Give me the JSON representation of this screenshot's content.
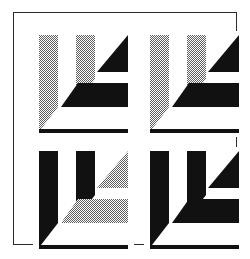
{
  "figure": {
    "background_color": "#ffffff",
    "frame": {
      "stroke_color": "#2b2b2b",
      "stroke_width_px": 1,
      "x": 13,
      "y": 12,
      "width": 224,
      "height": 233
    },
    "tones": {
      "black": "#111111",
      "halftone_gray": "#a8a8a8",
      "halftone_dot_color": "#6f6f6f",
      "paper": "#ffffff"
    },
    "grid": {
      "rows": 2,
      "columns": 2,
      "cell_width": 101,
      "cell_height": 106,
      "gap": 10
    },
    "motif": {
      "name": "angular-bracket-glyph",
      "parts": [
        "left-vertical-bar",
        "middle-vertical-bar",
        "upper-right-triangle",
        "horizontal-band",
        "baseline-rule"
      ]
    },
    "panels": [
      {
        "id": "panel-top-left",
        "position": "top-left",
        "label": "Panel 1",
        "left_bar_tone": "halftone",
        "middle_bar_tone": "halftone",
        "triangle_tone": "black",
        "band_tone": "black",
        "baseline_tone": "black"
      },
      {
        "id": "panel-top-right",
        "position": "top-right",
        "label": "Panel 2",
        "left_bar_tone": "halftone",
        "middle_bar_tone": "halftone",
        "triangle_tone": "black",
        "band_tone": "black",
        "baseline_tone": "black"
      },
      {
        "id": "panel-bottom-left",
        "position": "bottom-left",
        "label": "Panel 3",
        "left_bar_tone": "black",
        "middle_bar_tone": "black",
        "triangle_tone": "halftone",
        "band_tone": "halftone",
        "baseline_tone": "black"
      },
      {
        "id": "panel-bottom-right",
        "position": "bottom-right",
        "label": "Panel 4",
        "left_bar_tone": "black",
        "middle_bar_tone": "black",
        "triangle_tone": "black",
        "band_tone": "black",
        "baseline_tone": "black"
      }
    ]
  }
}
